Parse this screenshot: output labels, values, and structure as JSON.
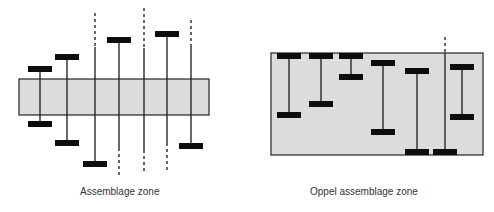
{
  "colors": {
    "zone_fill": "#dcdcdc",
    "zone_stroke": "#333333",
    "line": "#1a1a1a",
    "bar": "#0d0d0d"
  },
  "panels": [
    {
      "id": "assemblage-zone",
      "caption": "Assemblage zone",
      "caption_pos": {
        "x": 80,
        "y": 186
      },
      "zone_rect": {
        "x": 19,
        "y": 79,
        "w": 190,
        "h": 36
      },
      "ranges": [
        {
          "x": 40,
          "top": 69,
          "bottom": 124,
          "top_bar": true,
          "bottom_bar": true,
          "dash_top": null,
          "dash_bottom": null
        },
        {
          "x": 67,
          "top": 57,
          "bottom": 143,
          "top_bar": true,
          "bottom_bar": true,
          "dash_top": null,
          "dash_bottom": null
        },
        {
          "x": 95,
          "top": 47,
          "bottom": 164,
          "top_bar": false,
          "bottom_bar": true,
          "dash_top": 13,
          "dash_bottom": null
        },
        {
          "x": 119,
          "top": 40,
          "bottom": 148,
          "top_bar": true,
          "bottom_bar": false,
          "dash_top": null,
          "dash_bottom": 178
        },
        {
          "x": 144,
          "top": 48,
          "bottom": 150,
          "top_bar": false,
          "bottom_bar": false,
          "dash_top": 8,
          "dash_bottom": 174
        },
        {
          "x": 167,
          "top": 34,
          "bottom": 143,
          "top_bar": true,
          "bottom_bar": false,
          "dash_top": null,
          "dash_bottom": 172
        },
        {
          "x": 191,
          "top": 45,
          "bottom": 146,
          "top_bar": false,
          "bottom_bar": true,
          "dash_top": 20,
          "dash_bottom": null
        }
      ]
    },
    {
      "id": "oppel-assemblage-zone",
      "caption": "Oppel assemblage zone",
      "caption_pos": {
        "x": 310,
        "y": 186
      },
      "zone_rect": {
        "x": 271,
        "y": 53,
        "w": 212,
        "h": 102
      },
      "ranges": [
        {
          "x": 289,
          "top": 56,
          "bottom": 115,
          "top_bar": true,
          "bottom_bar": true,
          "dash_top": null,
          "dash_bottom": null
        },
        {
          "x": 321,
          "top": 56,
          "bottom": 104,
          "top_bar": true,
          "bottom_bar": true,
          "dash_top": null,
          "dash_bottom": null
        },
        {
          "x": 351,
          "top": 56,
          "bottom": 77,
          "top_bar": true,
          "bottom_bar": true,
          "dash_top": null,
          "dash_bottom": null
        },
        {
          "x": 383,
          "top": 63,
          "bottom": 132,
          "top_bar": true,
          "bottom_bar": true,
          "dash_top": null,
          "dash_bottom": null
        },
        {
          "x": 417,
          "top": 71,
          "bottom": 152,
          "top_bar": true,
          "bottom_bar": true,
          "dash_top": null,
          "dash_bottom": null
        },
        {
          "x": 445,
          "top": 53,
          "bottom": 152,
          "top_bar": false,
          "bottom_bar": true,
          "dash_top": 37,
          "dash_bottom": null
        },
        {
          "x": 462,
          "top": 67,
          "bottom": 117,
          "top_bar": true,
          "bottom_bar": true,
          "dash_top": null,
          "dash_bottom": null
        }
      ]
    }
  ]
}
